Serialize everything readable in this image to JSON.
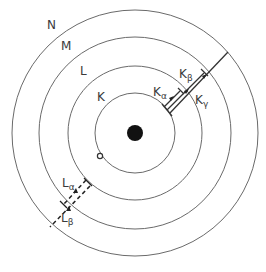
{
  "diagram": {
    "title": "",
    "nucleus": {
      "cx": 135,
      "cy": 133,
      "r": 8,
      "color": "#111111"
    },
    "shells": [
      {
        "label": "K",
        "r": 40,
        "label_x": 97,
        "label_y": 100
      },
      {
        "label": "L",
        "r": 67,
        "label_x": 79,
        "label_y": 75
      },
      {
        "label": "M",
        "r": 96,
        "label_x": 61,
        "label_y": 49
      },
      {
        "label": "N",
        "r": 123,
        "label_x": 47,
        "label_y": 30
      }
    ],
    "vacancy": {
      "cx": 100,
      "cy": 156,
      "r": 2.5
    },
    "k_transitions": [
      {
        "label": "Kα",
        "base": "K",
        "sub": "α",
        "from": "L",
        "style": "solid"
      },
      {
        "label": "Kβ",
        "base": "K",
        "sub": "β",
        "from": "M",
        "style": "solid"
      },
      {
        "label": "Kγ",
        "base": "K",
        "sub": "γ",
        "from": "N",
        "style": "solid"
      }
    ],
    "l_transitions": [
      {
        "label": "Lα",
        "base": "L",
        "sub": "α",
        "from": "M",
        "style": "dashed"
      },
      {
        "label": "Lβ",
        "base": "L",
        "sub": "β",
        "from": "N",
        "style": "dashed"
      }
    ],
    "labels": {
      "k_alpha": {
        "base": "K",
        "sub": "α"
      },
      "k_beta": {
        "base": "K",
        "sub": "β"
      },
      "k_gamma": {
        "base": "K",
        "sub": "γ"
      },
      "l_alpha": {
        "base": "L",
        "sub": "α"
      },
      "l_beta": {
        "base": "L",
        "sub": "β"
      }
    },
    "line_color": "#555555"
  }
}
